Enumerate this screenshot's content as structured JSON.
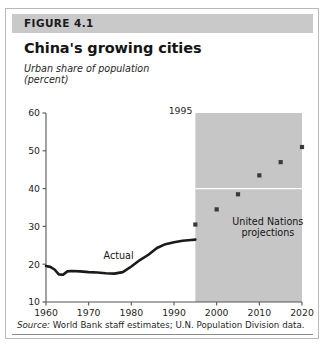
{
  "figure": {
    "number_label": "FIGURE 4.1",
    "title": "China's growing cities",
    "axis_caption": "Urban share of population\n(percent)",
    "source_prefix": "Source:",
    "source_text": " World Bank staff estimates; U.N. Population Division data."
  },
  "colors": {
    "header_band": "#c9c9c9",
    "projection_band": "#c6c6c6",
    "line": "#1a1a1a",
    "marker": "#3a3a3a",
    "gridline": "#ffffff",
    "axis": "#555555",
    "card_border": "#b9b9b9"
  },
  "chart_data": {
    "type": "line",
    "title": "China's growing cities",
    "xlabel": "",
    "ylabel": "Urban share of population (percent)",
    "xlim": [
      1960,
      2020
    ],
    "ylim": [
      10,
      60
    ],
    "xticks": [
      1960,
      1970,
      1980,
      1990,
      2000,
      2010,
      2020
    ],
    "yticks": [
      10,
      20,
      30,
      40,
      50,
      60
    ],
    "grid": false,
    "legend": "none",
    "annotations": [
      {
        "name": "actual-label",
        "text": "Actual",
        "x": 1977,
        "y": 21.5
      },
      {
        "name": "projection-label",
        "text": "United Nations\nprojections",
        "x": 2012,
        "y": 30.5
      },
      {
        "name": "projection-start-label",
        "text": "1995",
        "x": 1995,
        "y": 60
      }
    ],
    "shaded_region": {
      "label": "1995",
      "x_start": 1995,
      "x_end": 2020
    },
    "reference_line": {
      "y": 40,
      "color": "#ffffff"
    },
    "series": [
      {
        "name": "Actual",
        "type": "line",
        "x": [
          1960,
          1961,
          1962,
          1963,
          1964,
          1965,
          1966,
          1968,
          1970,
          1972,
          1974,
          1976,
          1978,
          1980,
          1982,
          1984,
          1986,
          1988,
          1990,
          1992,
          1994,
          1995
        ],
        "values": [
          19.5,
          19.3,
          18.6,
          17.3,
          17.2,
          18.1,
          18.2,
          18.1,
          17.9,
          17.8,
          17.6,
          17.5,
          17.9,
          19.4,
          21.1,
          22.5,
          24.3,
          25.3,
          25.8,
          26.2,
          26.4,
          26.5
        ]
      },
      {
        "name": "United Nations projections",
        "type": "scatter",
        "x": [
          1995,
          2000,
          2005,
          2010,
          2015,
          2020
        ],
        "values": [
          30.5,
          34.5,
          38.5,
          43.5,
          47.0,
          51.0
        ]
      }
    ]
  }
}
